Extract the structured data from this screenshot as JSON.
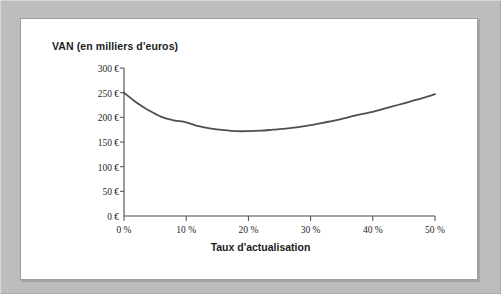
{
  "figure": {
    "title": "VAN (en milliers d'euros)",
    "xaxis_title": "Taux d'actualisation",
    "frame_color": "#bdbdbd",
    "panel_color": "#ffffff",
    "curve_color": "#4f4f4f",
    "axis_color": "#4a4a4a"
  },
  "chart_data": {
    "type": "line",
    "title": "VAN (en milliers d'euros)",
    "subtitle": "",
    "xlabel": "Taux d'actualisation",
    "ylabel": "VAN (en milliers d'euros)",
    "xlim": [
      0,
      50
    ],
    "ylim": [
      0,
      300
    ],
    "grid": false,
    "legend": null,
    "xtick_labels": [
      "0 %",
      "10 %",
      "20 %",
      "30 %",
      "40 %",
      "50 %"
    ],
    "xticks": [
      0,
      10,
      20,
      30,
      40,
      50
    ],
    "ytick_labels": [
      "0 €",
      "50 €",
      "100 €",
      "150 €",
      "200 €",
      "250 €",
      "300 €"
    ],
    "yticks": [
      0,
      50,
      100,
      150,
      200,
      250,
      300
    ],
    "x_unit": "%",
    "y_unit": "€",
    "series": [
      {
        "name": "VAN",
        "color": "#4f4f4f",
        "x": [
          0,
          2,
          4,
          6,
          8,
          10,
          12,
          14,
          16,
          18,
          20,
          22,
          24,
          26,
          28,
          30,
          32,
          34,
          36,
          38,
          40,
          42,
          44,
          46,
          48,
          50
        ],
        "values": [
          250,
          230,
          214,
          201,
          194,
          190,
          182,
          177,
          174,
          172,
          172,
          173,
          175,
          177,
          180,
          184,
          189,
          194,
          200,
          206,
          211,
          218,
          225,
          232,
          239,
          247
        ]
      }
    ],
    "annotations": [
      {
        "text": "minimum",
        "x": 19,
        "y": 172
      }
    ]
  }
}
